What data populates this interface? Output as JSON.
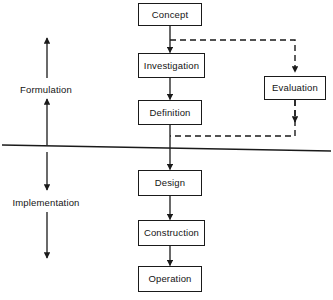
{
  "diagram": {
    "background_color": "#ffffff",
    "line_color": "#1a1a1a",
    "text_color": "#141414",
    "nodes": [
      {
        "id": "concept",
        "label": "Concept",
        "x": 138,
        "y": 3,
        "w": 64,
        "h": 23
      },
      {
        "id": "investigation",
        "label": "Investigation",
        "x": 138,
        "y": 53,
        "w": 67,
        "h": 25
      },
      {
        "id": "definition",
        "label": "Definition",
        "x": 138,
        "y": 100,
        "w": 64,
        "h": 25
      },
      {
        "id": "evaluation",
        "label": "Evaluation",
        "x": 264,
        "y": 76,
        "w": 62,
        "h": 24
      },
      {
        "id": "design",
        "label": "Design",
        "x": 138,
        "y": 170,
        "w": 64,
        "h": 26
      },
      {
        "id": "construction",
        "label": "Construction",
        "x": 138,
        "y": 220,
        "w": 67,
        "h": 26
      },
      {
        "id": "operation",
        "label": "Operation",
        "x": 138,
        "y": 266,
        "w": 64,
        "h": 26
      }
    ],
    "phases": [
      {
        "id": "formulation",
        "label": "Formulation",
        "x": 8,
        "y": 84,
        "w": 76
      },
      {
        "id": "implementation",
        "label": "Implementation",
        "x": 4,
        "y": 197,
        "w": 84
      }
    ],
    "flow_edges": [
      {
        "from": "concept",
        "to": "investigation",
        "style": "solid"
      },
      {
        "from": "investigation",
        "to": "definition",
        "style": "solid"
      },
      {
        "from": "definition",
        "to": "design",
        "style": "solid"
      },
      {
        "from": "design",
        "to": "construction",
        "style": "solid"
      },
      {
        "from": "construction",
        "to": "operation",
        "style": "solid"
      }
    ],
    "feedback_edges": [
      {
        "from": "concept",
        "to": "evaluation",
        "style": "dashed",
        "note": "concept branch to evaluation"
      },
      {
        "from": "evaluation",
        "to": "definition",
        "style": "dashed",
        "note": "evaluation return to definition"
      }
    ],
    "divider": {
      "note": "boundary separating formulation from implementation"
    }
  }
}
